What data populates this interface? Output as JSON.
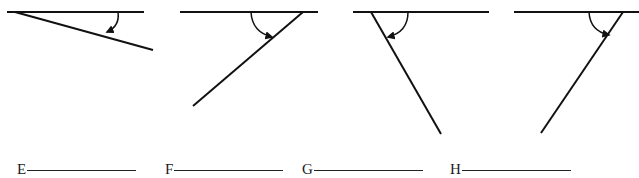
{
  "colors": {
    "stroke": "#111111",
    "background": "#ffffff"
  },
  "figures": [
    {
      "id": "E",
      "description": "acute angle opening to the lower right; curved arrow from horizontal line to slanted line",
      "horizontal": {
        "x1": 7,
        "y1": 12,
        "x2": 144,
        "y2": 12
      },
      "ray": {
        "x1": 15,
        "y1": 12,
        "x2": 153,
        "y2": 50
      },
      "arc": {
        "start": [
          118,
          12
        ],
        "control": [
          120,
          26
        ],
        "end": [
          107,
          32
        ]
      },
      "arrow_icon": "arrowhead-down-left"
    },
    {
      "id": "F",
      "description": "acute angle opening to the lower left; curved arrow from horizontal line to slanted line",
      "horizontal": {
        "x1": 180,
        "y1": 12,
        "x2": 318,
        "y2": 12
      },
      "ray": {
        "x1": 303,
        "y1": 12,
        "x2": 193,
        "y2": 106
      },
      "arc": {
        "start": [
          251,
          12
        ],
        "control": [
          252,
          32
        ],
        "end": [
          272,
          37
        ]
      },
      "arrow_icon": "arrowhead-right"
    },
    {
      "id": "G",
      "description": "obtuse-looking angle with ray going down to the right; curved arrow from horizontal line to slanted line",
      "horizontal": {
        "x1": 353,
        "y1": 12,
        "x2": 489,
        "y2": 12
      },
      "ray": {
        "x1": 371,
        "y1": 12,
        "x2": 441,
        "y2": 134
      },
      "arc": {
        "start": [
          408,
          12
        ],
        "control": [
          408,
          32
        ],
        "end": [
          388,
          37
        ]
      },
      "arrow_icon": "arrowhead-left"
    },
    {
      "id": "H",
      "description": "acute angle with ray going down to the left; curved arrow from horizontal line to slanted line",
      "horizontal": {
        "x1": 514,
        "y1": 12,
        "x2": 639,
        "y2": 12
      },
      "ray": {
        "x1": 623,
        "y1": 12,
        "x2": 541,
        "y2": 133
      },
      "arc": {
        "start": [
          589,
          12
        ],
        "control": [
          590,
          31
        ],
        "end": [
          609,
          35
        ]
      },
      "arrow_icon": "arrowhead-right"
    }
  ],
  "answers": [
    {
      "label": "E",
      "x": 17,
      "value": ""
    },
    {
      "label": "F",
      "x": 165,
      "value": ""
    },
    {
      "label": "G",
      "x": 302,
      "value": ""
    },
    {
      "label": "H",
      "x": 450,
      "value": ""
    }
  ]
}
